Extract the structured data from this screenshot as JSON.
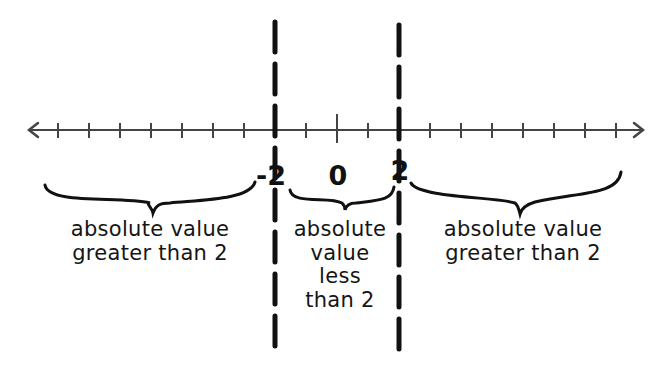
{
  "diagram": {
    "type": "number-line",
    "range": {
      "min": -9,
      "max": 9,
      "step": 1
    },
    "tick_values": [
      -9,
      -8,
      -7,
      -6,
      -5,
      -4,
      -3,
      -2,
      -1,
      0,
      1,
      2,
      3,
      4,
      5,
      6,
      7,
      8,
      9
    ],
    "labeled_points": [
      {
        "value": -2,
        "label": "-2"
      },
      {
        "value": 0,
        "label": "0"
      },
      {
        "value": 2,
        "label": "2"
      }
    ],
    "boundaries": [
      {
        "value": -2,
        "style": "dashed-vertical"
      },
      {
        "value": 2,
        "style": "dashed-vertical"
      }
    ],
    "regions": [
      {
        "id": "left",
        "text": "absolute value\ngreater than 2"
      },
      {
        "id": "middle",
        "text": "absolute\nvalue\nless\nthan 2"
      },
      {
        "id": "right",
        "text": "absolute value\ngreater than 2"
      }
    ],
    "colors": {
      "ink": "#111111",
      "axis": "#444444",
      "background": "#ffffff"
    }
  }
}
